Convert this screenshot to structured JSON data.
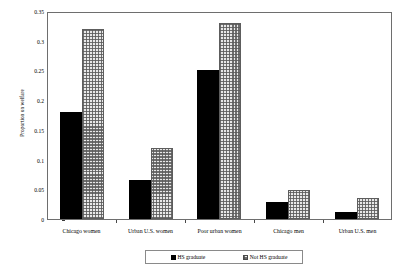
{
  "chart_data": {
    "type": "bar",
    "title": "",
    "xlabel": "",
    "ylabel": "Proportion on welfare",
    "categories": [
      "Chicago women",
      "Urban U.S. women",
      "Poor urban women",
      "Chicago men",
      "Urban U.S. men"
    ],
    "series": [
      {
        "name": "HS graduate",
        "color": "#000000",
        "values": [
          0.18,
          0.065,
          0.25,
          0.028,
          0.012
        ]
      },
      {
        "name": "Not HS graduate",
        "color": "#e8e8e8",
        "values": [
          0.32,
          0.12,
          0.33,
          0.048,
          0.035
        ]
      }
    ],
    "ylim": [
      0,
      0.35
    ],
    "yticks": [
      "0",
      "0.05",
      "0.1",
      "0.15",
      "0.2",
      "0.25",
      "0.3",
      "0.35"
    ],
    "ytick_values": [
      0,
      0.05,
      0.1,
      0.15,
      0.2,
      0.25,
      0.3,
      0.35
    ],
    "grid": false,
    "legend_position": "bottom-center",
    "legend_entries": [
      "HS graduate",
      "Not HS graduate"
    ]
  }
}
